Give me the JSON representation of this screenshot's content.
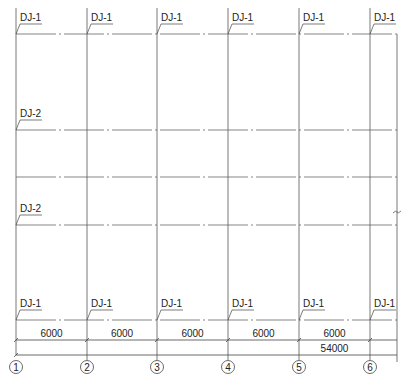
{
  "drawing": {
    "grid_axes": [
      "1",
      "2",
      "3",
      "4",
      "5",
      "6"
    ],
    "bay_dimensions": [
      "6000",
      "6000",
      "6000",
      "6000",
      "6000"
    ],
    "total_dimension": "54000",
    "top_labels": [
      "DJ-1",
      "DJ-1",
      "DJ-1",
      "DJ-1",
      "DJ-1",
      "DJ-1"
    ],
    "bottom_labels": [
      "DJ-1",
      "DJ-1",
      "DJ-1",
      "DJ-1",
      "DJ-1",
      "DJ-1"
    ],
    "left_labels": [
      "DJ-2",
      "DJ-2"
    ],
    "break_symbol": "~"
  }
}
